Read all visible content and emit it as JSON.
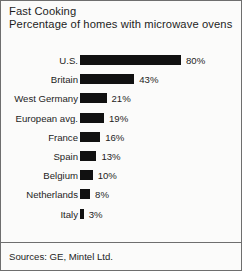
{
  "chart_data": {
    "type": "bar",
    "orientation": "horizontal",
    "title": "Fast Cooking",
    "subtitle": "Percentage of homes with microwave ovens",
    "xlabel": "",
    "ylabel": "",
    "xlim": [
      0,
      80
    ],
    "grid": false,
    "legend": false,
    "categories": [
      "U.S.",
      "Britain",
      "West Germany",
      "European avg.",
      "France",
      "Spain",
      "Belgium",
      "Netherlands",
      "Italy"
    ],
    "values": [
      80,
      43,
      21,
      19,
      16,
      13,
      10,
      8,
      3
    ],
    "value_labels": [
      "80%",
      "43%",
      "21%",
      "19%",
      "16%",
      "13%",
      "10%",
      "8%",
      "3%"
    ],
    "bar_color": "#111111",
    "source_note": "Sources: GE, Mintel Ltd."
  },
  "frame": {
    "background_color": "#fbfbfa",
    "border_color": "#6e6e6e"
  }
}
